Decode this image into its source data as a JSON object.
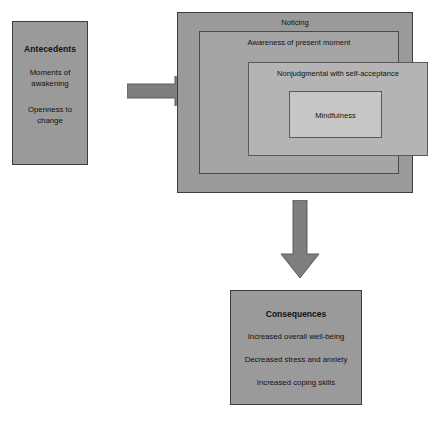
{
  "diagram": {
    "colors": {
      "outer_box": "#9a9a9a",
      "second_box": "#a5a5a5",
      "third_box": "#b4b4b4",
      "inner_box": "#c6c6c6",
      "arrow": "#7e7e7e",
      "border": "#3d3d3d",
      "text": "#111111",
      "background": "#ffffff"
    },
    "antecedents": {
      "title": "Antecedents",
      "items": [
        "Moments of awakening",
        "Openness to change"
      ]
    },
    "attributes": {
      "outer_label": "Noticing",
      "second_label": "Awareness of present moment",
      "third_label": "Nonjudgmental with self-acceptance",
      "core_label": "Mindfulness"
    },
    "consequences": {
      "title": "Consequences",
      "items": [
        "Increased overall well-being",
        "Decreased stress and anxiety",
        "Increased coping skills"
      ]
    },
    "arrows": [
      {
        "name": "antecedents-to-attributes",
        "direction": "right"
      },
      {
        "name": "attributes-to-consequences",
        "direction": "down"
      }
    ]
  }
}
